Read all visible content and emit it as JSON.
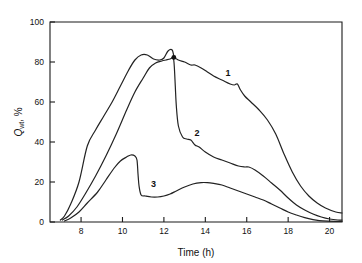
{
  "chart_data": {
    "type": "line",
    "title": "",
    "xlabel": "Time (h)",
    "ylabel": "Q_wt, %",
    "ylabel_base": "Q",
    "ylabel_sub": "wt",
    "ylabel_suffix": ", %",
    "xlim": [
      6.5,
      20.6
    ],
    "ylim": [
      0,
      100
    ],
    "xticks": [
      8,
      10,
      12,
      14,
      16,
      18,
      20
    ],
    "xtick_labels": [
      "8",
      "10",
      "12",
      "14",
      "16",
      "18",
      "20"
    ],
    "yticks": [
      0,
      20,
      40,
      60,
      80,
      100
    ],
    "ytick_labels": [
      "0",
      "20",
      "40",
      "60",
      "80",
      "100"
    ],
    "grid": false,
    "legend_position": "inline-annotations",
    "line_color": "#222222",
    "series": [
      {
        "name": "1",
        "label": "1",
        "label_x": 15.1,
        "label_y": 73,
        "x": [
          7.0,
          7.2,
          7.5,
          7.9,
          8.3,
          8.7,
          9.1,
          9.5,
          9.9,
          10.3,
          10.6,
          10.9,
          11.2,
          11.5,
          11.8,
          12.0,
          12.2,
          12.4,
          12.5,
          12.7,
          13.0,
          13.3,
          13.5,
          13.8,
          14.1,
          14.4,
          14.8,
          15.2,
          15.4,
          15.55,
          15.7,
          15.9,
          16.2,
          16.6,
          17.0,
          17.4,
          17.8,
          18.2,
          18.6,
          19.0,
          19.4,
          19.8,
          20.3,
          20.6
        ],
        "y": [
          1.0,
          3.0,
          9.0,
          20.0,
          38.0,
          46.0,
          53.0,
          60.0,
          68.0,
          76.0,
          81.0,
          83.5,
          83.5,
          81.5,
          81.0,
          82.0,
          85.5,
          86.0,
          82.5,
          81.0,
          80.0,
          78.5,
          78.5,
          77.0,
          75.0,
          73.0,
          71.0,
          69.0,
          68.5,
          69.0,
          66.0,
          63.0,
          60.0,
          56.0,
          51.0,
          44.0,
          34.0,
          25.0,
          18.0,
          13.0,
          9.5,
          7.0,
          5.0,
          4.5
        ]
      },
      {
        "name": "2",
        "label": "2",
        "label_x": 13.6,
        "label_y": 43,
        "x": [
          7.1,
          7.4,
          7.8,
          8.2,
          8.7,
          9.2,
          9.7,
          10.2,
          10.6,
          11.0,
          11.3,
          11.6,
          11.9,
          12.1,
          12.3,
          12.45,
          12.5,
          12.55,
          12.6,
          12.7,
          12.9,
          13.1,
          13.3,
          13.5,
          13.7,
          14.0,
          14.4,
          14.8,
          15.2,
          15.6,
          15.9,
          16.1,
          16.4,
          16.8,
          17.2,
          17.6,
          18.0,
          18.4,
          18.8,
          19.2,
          19.6,
          20.0,
          20.4,
          20.6
        ],
        "y": [
          1.0,
          3.0,
          7.5,
          14.0,
          23.0,
          33.0,
          44.0,
          56.0,
          65.0,
          72.0,
          77.0,
          79.5,
          80.5,
          81.0,
          81.5,
          82.0,
          78.0,
          68.0,
          58.0,
          48.0,
          42.5,
          41.5,
          41.0,
          38.5,
          37.5,
          35.0,
          32.5,
          31.0,
          29.5,
          28.0,
          27.5,
          27.5,
          26.0,
          23.0,
          19.5,
          16.0,
          12.0,
          8.5,
          6.0,
          4.0,
          2.5,
          1.5,
          1.0,
          1.0
        ]
      },
      {
        "name": "3",
        "label": "3",
        "label_x": 11.5,
        "label_y": 17.5,
        "x": [
          7.2,
          7.5,
          7.9,
          8.3,
          8.8,
          9.2,
          9.6,
          9.9,
          10.2,
          10.4,
          10.6,
          10.7,
          10.75,
          10.8,
          10.9,
          11.1,
          11.4,
          11.7,
          12.0,
          12.3,
          12.6,
          13.0,
          13.4,
          13.8,
          14.1,
          14.4,
          14.8,
          15.2,
          15.6,
          16.0,
          16.4,
          16.8,
          17.2,
          17.6,
          18.0,
          18.4,
          18.8,
          19.2,
          19.5,
          19.9,
          20.3,
          20.6
        ],
        "y": [
          0.5,
          2.0,
          5.0,
          9.5,
          15.0,
          21.0,
          27.0,
          30.5,
          32.5,
          33.5,
          33.0,
          31.0,
          24.0,
          18.0,
          13.5,
          13.0,
          12.5,
          12.5,
          13.0,
          14.0,
          15.5,
          17.5,
          19.0,
          19.7,
          19.7,
          19.3,
          18.5,
          17.0,
          15.5,
          14.0,
          12.5,
          11.0,
          9.0,
          7.0,
          5.0,
          3.5,
          2.2,
          1.2,
          0.7,
          0.4,
          0.3,
          0.3
        ]
      }
    ],
    "markers": [
      {
        "x": 12.48,
        "y": 82.3
      }
    ]
  },
  "axes": {
    "x_title": "Time (h)",
    "y_title_main": "Q",
    "y_title_sub": "wt",
    "y_title_tail": ", %"
  }
}
